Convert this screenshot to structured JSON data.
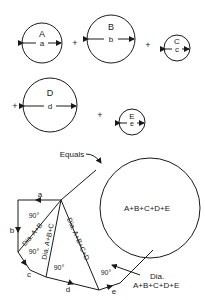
{
  "circles": [
    {
      "label": "A",
      "dim": "a"
    },
    {
      "label": "B",
      "dim": "b"
    },
    {
      "label": "C",
      "dim": "c"
    },
    {
      "label": "D",
      "dim": "d"
    },
    {
      "label": "E",
      "dim": "e"
    }
  ],
  "operators": {
    "plus": "+"
  },
  "equals_label": "Equals",
  "result_label": "A+B+C+D+E",
  "construction": {
    "sides": [
      "a",
      "b",
      "c",
      "d",
      "e"
    ],
    "diagonals": [
      "Dia. A+B",
      "Dia. A+B+C",
      "Dia. A+B+C+D"
    ],
    "final_dia_line1": "Dia.",
    "final_dia_line2": "A+B+C+D+E",
    "right_angle": "90°"
  },
  "colors": {
    "stroke": "#1a1a1a",
    "background": "#ffffff"
  }
}
